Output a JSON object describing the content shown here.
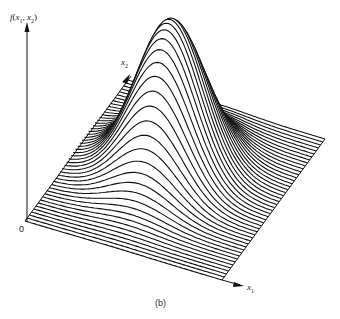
{
  "figure": {
    "caption": "(b)",
    "z_axis_label": {
      "f": "f",
      "open": "(",
      "var1": "x",
      "sub1": "1",
      "comma": ", ",
      "var2": "x",
      "sub2": "2",
      "close": ")"
    },
    "x1_axis_label": {
      "var": "x",
      "sub": "1"
    },
    "x2_axis_label": {
      "var": "x",
      "sub": "2"
    },
    "origin_label": "0",
    "line_color": "#111111",
    "background": "#ffffff"
  },
  "chart_data": {
    "type": "surface",
    "title": "",
    "xlabel": "x1",
    "ylabel": "x2",
    "zlabel": "f(x1, x2)",
    "origin": "0",
    "n_profile_lines": 48,
    "peak": {
      "x1_fraction": 0.45,
      "x2_fraction": 0.55
    },
    "spread": {
      "x1_fraction": 0.16,
      "x2_fraction": 0.16
    },
    "peak_height_px": 150,
    "grid": false
  }
}
